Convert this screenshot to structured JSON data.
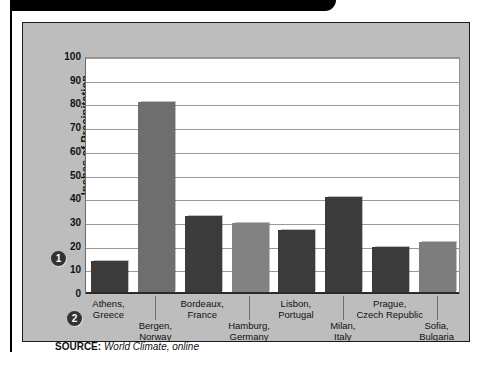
{
  "figure": {
    "source_label": "SOURCE:",
    "source_value": "World Climate, online",
    "callout_1": "1",
    "callout_2": "2"
  },
  "chart_data": {
    "type": "bar",
    "title": "",
    "xlabel": "",
    "ylabel": "Inches of Precipitation",
    "ylim": [
      0,
      100
    ],
    "ytick_step": 10,
    "grid": true,
    "legend": "none",
    "ytick_labels": [
      "100",
      "90",
      "80",
      "70",
      "60",
      "50",
      "40",
      "30",
      "20",
      "10",
      "0"
    ],
    "categories": [
      "Athens,\nGreece",
      "Bergen,\nNorway",
      "Bordeaux,\nFrance",
      "Hamburg,\nGermany",
      "Lisbon,\nPortugal",
      "Milan,\nItaly",
      "Prague,\nCzech Republic",
      "Sofia,\nBulgaria"
    ],
    "category_lines": [
      [
        "Athens,",
        "Greece"
      ],
      [
        "Bergen,",
        "Norway"
      ],
      [
        "Bordeaux,",
        "France"
      ],
      [
        "Hamburg,",
        "Germany"
      ],
      [
        "Lisbon,",
        "Portugal"
      ],
      [
        "Milan,",
        "Italy"
      ],
      [
        "Prague,",
        "Czech Republic"
      ],
      [
        "Sofia,",
        "Bulgaria"
      ]
    ],
    "values": [
      14,
      81,
      33,
      30,
      27,
      41,
      20,
      22
    ],
    "bar_colors": [
      "#3b3b3b",
      "#6e6e6e",
      "#3b3b3b",
      "#828282",
      "#3b3b3b",
      "#3b3b3b",
      "#3b3b3b",
      "#7d7d7d"
    ],
    "units": "inches"
  },
  "colors": {
    "panel": "#bdbdbd",
    "plot": "#ffffff",
    "grid": "#9a9a9a",
    "axis": "#2a2a2a",
    "dark_bar": "#3b3b3b",
    "gray_bar": "#7d7d7d",
    "frame": "#1a1a1a"
  }
}
